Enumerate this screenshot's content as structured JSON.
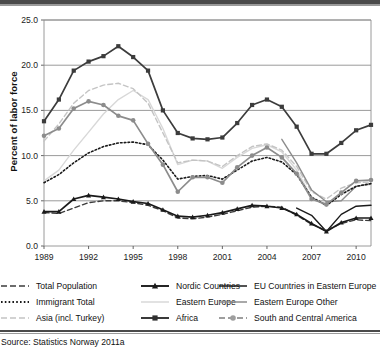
{
  "axes": {
    "ylabel": "Percent of labor force",
    "yticks": [
      "0.0",
      "5.0",
      "10.0",
      "15.0",
      "20.0",
      "25.0"
    ],
    "xticks": [
      "1989",
      "1992",
      "1995",
      "1998",
      "2001",
      "2004",
      "2007",
      "2010"
    ],
    "ylim": [
      0.0,
      25.0
    ],
    "xlim": [
      1989,
      2011
    ]
  },
  "source": "Source: Statistics Norway 2011a",
  "legend": {
    "rows": [
      [
        {
          "label": "Total Population",
          "style": "dashed",
          "color": "#3c3c3c",
          "marker": "none"
        },
        {
          "label": "Nordic Countries",
          "style": "solid",
          "color": "#1a1a1a",
          "marker": "triangle"
        },
        {
          "label": "EU Countries in Eastern Europe",
          "style": "solid",
          "color": "#1a1a1a",
          "marker": "none"
        }
      ],
      [
        {
          "label": "Immigrant Total",
          "style": "dotted",
          "color": "#1a1a1a",
          "marker": "none"
        },
        {
          "label": "Eastern Europe",
          "style": "solid",
          "color": "#d8d8d8",
          "marker": "none"
        },
        {
          "label": "Eastern Europe Other",
          "style": "solid",
          "color": "#8c8c8c",
          "marker": "none"
        }
      ],
      [
        {
          "label": "Asia (incl. Turkey)",
          "style": "dashed",
          "color": "#c4c4c4",
          "marker": "none"
        },
        {
          "label": "Africa",
          "style": "solid",
          "color": "#303030",
          "marker": "square"
        },
        {
          "label": "South and Central America",
          "style": "dashed",
          "color": "#9e9e9e",
          "marker": "circle"
        }
      ]
    ]
  },
  "chart_data": {
    "type": "line",
    "title": "",
    "xlabel": "",
    "ylabel": "Percent of labor force",
    "xlim": [
      1989,
      2011
    ],
    "ylim": [
      0.0,
      25.0
    ],
    "grid": "horizontal",
    "legend_position": "below",
    "x": [
      1989,
      1990,
      1991,
      1992,
      1993,
      1994,
      1995,
      1996,
      1997,
      1998,
      1999,
      2000,
      2001,
      2002,
      2003,
      2004,
      2005,
      2006,
      2007,
      2008,
      2009,
      2010,
      2011
    ],
    "series": [
      {
        "name": "Africa",
        "style": "solid",
        "color": "#3c3c3c",
        "marker": "square",
        "values": [
          13.8,
          16.2,
          19.4,
          20.4,
          21.0,
          22.1,
          20.9,
          19.4,
          15.0,
          12.5,
          11.9,
          11.8,
          12.0,
          13.6,
          15.6,
          16.2,
          15.4,
          13.2,
          10.2,
          10.2,
          11.4,
          12.8,
          13.4
        ]
      },
      {
        "name": "South and Central America",
        "style": "solid",
        "color": "#8c8c8c",
        "marker": "circle",
        "values": [
          12.2,
          13.0,
          15.2,
          16.0,
          15.6,
          14.4,
          13.9,
          11.3,
          9.0,
          6.0,
          7.6,
          7.6,
          7.0,
          8.7,
          10.0,
          10.9,
          9.8,
          8.0,
          5.2,
          4.6,
          5.9,
          7.2,
          7.3
        ]
      },
      {
        "name": "Immigrant Total",
        "style": "dotted",
        "color": "#1a1a1a",
        "marker": "none",
        "values": [
          7.0,
          7.9,
          9.2,
          10.3,
          11.0,
          11.4,
          11.5,
          11.2,
          9.5,
          7.4,
          7.7,
          7.8,
          7.4,
          8.4,
          9.4,
          9.8,
          9.3,
          7.9,
          5.4,
          4.5,
          5.7,
          6.6,
          6.9
        ]
      },
      {
        "name": "Asia (incl. Turkey)",
        "style": "dashed",
        "color": "#c4c4c4",
        "marker": "none",
        "values": [
          11.6,
          13.5,
          15.8,
          17.2,
          17.8,
          18.0,
          17.4,
          15.8,
          12.5,
          9.2,
          9.5,
          9.4,
          8.8,
          10.0,
          11.0,
          11.3,
          10.6,
          8.8,
          6.0,
          5.2,
          6.4,
          7.0,
          7.1
        ]
      },
      {
        "name": "Eastern Europe",
        "style": "solid",
        "color": "#d8d8d8",
        "marker": "none",
        "values": [
          7.2,
          8.4,
          10.6,
          12.6,
          14.6,
          16.2,
          17.2,
          16.2,
          13.0,
          9.0,
          9.5,
          9.4,
          8.6,
          9.8,
          10.8,
          11.2,
          10.4,
          8.4,
          5.4,
          4.4,
          5.8,
          6.6,
          6.8
        ]
      },
      {
        "name": "Eastern Europe Other",
        "style": "solid",
        "color": "#8c8c8c",
        "marker": "none",
        "values": [
          null,
          null,
          null,
          null,
          null,
          null,
          null,
          null,
          null,
          null,
          null,
          null,
          null,
          null,
          null,
          null,
          11.8,
          9.2,
          6.2,
          4.9,
          5.0,
          6.6,
          6.9
        ]
      },
      {
        "name": "EU Countries in Eastern Europe",
        "style": "solid",
        "color": "#1a1a1a",
        "marker": "none",
        "values": [
          null,
          null,
          null,
          null,
          null,
          null,
          null,
          null,
          null,
          null,
          null,
          null,
          null,
          null,
          null,
          null,
          null,
          4.2,
          3.4,
          1.6,
          3.5,
          4.4,
          4.5
        ]
      },
      {
        "name": "Total Population",
        "style": "dashed",
        "color": "#3c3c3c",
        "marker": "none",
        "values": [
          3.7,
          3.6,
          4.2,
          4.8,
          5.0,
          5.0,
          4.8,
          4.5,
          3.9,
          3.1,
          3.0,
          3.2,
          3.5,
          3.9,
          4.3,
          4.4,
          4.3,
          3.4,
          2.4,
          1.7,
          2.5,
          2.9,
          2.8
        ]
      },
      {
        "name": "Nordic Countries",
        "style": "solid",
        "color": "#1a1a1a",
        "marker": "triangle",
        "values": [
          3.8,
          3.8,
          5.2,
          5.6,
          5.4,
          5.2,
          4.9,
          4.7,
          4.0,
          3.3,
          3.2,
          3.4,
          3.7,
          4.1,
          4.5,
          4.4,
          4.2,
          3.5,
          2.5,
          1.6,
          2.6,
          3.1,
          3.1
        ]
      }
    ]
  }
}
